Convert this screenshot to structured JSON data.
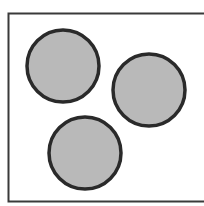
{
  "diagram": {
    "background": "#ffffff",
    "frame": {
      "x": 8.5,
      "y": 13.5,
      "width": 210,
      "height": 188,
      "stroke": "#3a3a3a",
      "stroke_width": 2
    },
    "circles": [
      {
        "id": "circle-top-left",
        "cx": 63,
        "cy": 66,
        "r": 36,
        "fill": "#b9b9b9",
        "stroke": "#2a2a2a",
        "stroke_width": 3.5
      },
      {
        "id": "circle-right",
        "cx": 149,
        "cy": 90,
        "r": 36,
        "fill": "#b9b9b9",
        "stroke": "#2a2a2a",
        "stroke_width": 3.5
      },
      {
        "id": "circle-bottom",
        "cx": 85,
        "cy": 153,
        "r": 36,
        "fill": "#b9b9b9",
        "stroke": "#2a2a2a",
        "stroke_width": 3.5
      }
    ]
  }
}
